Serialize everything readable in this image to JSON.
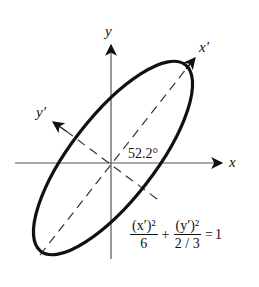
{
  "diagram": {
    "axes": {
      "x_label": "x",
      "y_label": "y",
      "x_prime_label": "x′",
      "y_prime_label": "y′"
    },
    "rotation_angle": "52.2°",
    "equation": {
      "term1_numerator": "(x′)²",
      "term1_denominator": "6",
      "plus": "+",
      "term2_numerator": "(y′)²",
      "term2_denominator": "2 / 3",
      "equals": "=",
      "rhs": "1"
    },
    "ellipse": {
      "a_squared": 6,
      "b_squared": "2/3",
      "rotation_deg": 52.2
    },
    "colors": {
      "stroke": "#111111",
      "background": "#ffffff"
    }
  }
}
